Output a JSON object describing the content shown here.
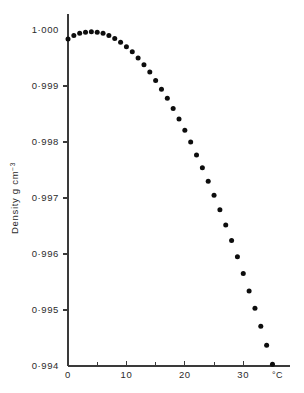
{
  "chart_data": {
    "type": "scatter",
    "title": "",
    "subtitle": "",
    "xlabel": "",
    "ylabel": "Density g cm",
    "ylabel_superscript": "-3",
    "x_unit": "°C",
    "xlim": [
      0,
      38
    ],
    "ylim": [
      0.994,
      1.0003
    ],
    "grid": false,
    "legend": null,
    "x_ticks_major": [
      0,
      10,
      20,
      30
    ],
    "x_tick_labels": [
      "0",
      "10",
      "20",
      "30"
    ],
    "x_ticks_minor": [
      5,
      15,
      25,
      35
    ],
    "y_ticks": [
      1.0,
      0.999,
      0.998,
      0.997,
      0.996,
      0.995,
      0.994
    ],
    "y_tick_labels": [
      "1·000",
      "0·999",
      "0·998",
      "0·997",
      "0·996",
      "0·995",
      "0·994"
    ],
    "marker": "filled-circle",
    "marker_color": "#0d0d0d",
    "marker_size_px": 5,
    "series": [
      {
        "name": "Density of water",
        "x": [
          0,
          1,
          2,
          3,
          4,
          5,
          6,
          7,
          8,
          9,
          10,
          11,
          12,
          13,
          14,
          15,
          16,
          17,
          18,
          19,
          20,
          21,
          22,
          23,
          24,
          25,
          26,
          27,
          28,
          29,
          30,
          31,
          32,
          33,
          34,
          35
        ],
        "y": [
          0.99984,
          0.9999,
          0.99994,
          0.99996,
          0.99997,
          0.99996,
          0.99994,
          0.9999,
          0.99985,
          0.99978,
          0.9997,
          0.99961,
          0.9995,
          0.99938,
          0.99925,
          0.9991,
          0.99894,
          0.99878,
          0.9986,
          0.99841,
          0.99821,
          0.998,
          0.99777,
          0.99754,
          0.9973,
          0.99705,
          0.99679,
          0.99652,
          0.99624,
          0.99595,
          0.99565,
          0.99534,
          0.99503,
          0.99471,
          0.99437,
          0.99403
        ]
      }
    ]
  },
  "axes": {
    "y_title_main": "Density g cm",
    "y_title_exp": "−3",
    "x_unit_label": "°C"
  }
}
